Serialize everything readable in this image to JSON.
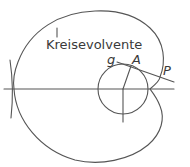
{
  "diagram": {
    "title": "Kreisevolvente",
    "labels": {
      "tangent": "g",
      "tangent_point": "A",
      "curve_point": "P"
    },
    "colors": {
      "stroke": "#555555",
      "text": "#3a3a3a",
      "background": "#ffffff"
    },
    "geometry": {
      "axis_y": 89,
      "circle_center": [
        123,
        89
      ],
      "circle_radius": 25
    }
  }
}
